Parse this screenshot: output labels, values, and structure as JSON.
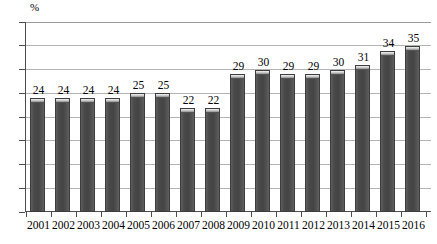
{
  "chart_data": {
    "type": "bar",
    "title": "",
    "subtitle": "",
    "xlabel": "",
    "ylabel": "%",
    "unit_label": "%",
    "categories": [
      "2001",
      "2002",
      "2003",
      "2004",
      "2005",
      "2006",
      "2007",
      "2008",
      "2009",
      "2010",
      "2011",
      "2012",
      "2013",
      "2014",
      "2015",
      "2016"
    ],
    "values": [
      24,
      24,
      24,
      24,
      25,
      25,
      22,
      22,
      29,
      30,
      29,
      29,
      30,
      31,
      34,
      35
    ],
    "data_labels": [
      "24",
      "24",
      "24",
      "24",
      "25",
      "25",
      "22",
      "22",
      "29",
      "30",
      "29",
      "29",
      "30",
      "31",
      "34",
      "35"
    ],
    "ylim": [
      0,
      40
    ],
    "yticks": [
      0,
      5,
      10,
      15,
      20,
      25,
      30,
      35,
      40
    ],
    "ytick_labels": [
      "0",
      "5",
      "10",
      "15",
      "20",
      "25",
      "30",
      "35",
      "40"
    ],
    "grid": true,
    "grid_orientation": "horizontal",
    "legend": false,
    "legend_position": "none",
    "series": [
      {
        "name": "",
        "values": [
          24,
          24,
          24,
          24,
          25,
          25,
          22,
          22,
          29,
          30,
          29,
          29,
          30,
          31,
          34,
          35
        ],
        "color": "#4a4a4a"
      }
    ]
  },
  "style": {
    "bar_color": "#4a4a4a",
    "bar_border_color": "#3d3d3d",
    "bar_cap_color": "#d9d9d9",
    "grid_color": "#b3b3b3",
    "axis_color": "#4d4d4d",
    "text_color": "#000000",
    "background_color": "#ffffff"
  }
}
